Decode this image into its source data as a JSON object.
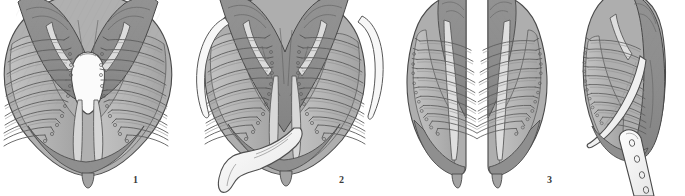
{
  "plate": {
    "kind": "scientific-anatomical-illustration",
    "subject": "bivalve mollusc gill / ctenidium dissections, ventral and lateral views",
    "background_color": "#ffffff",
    "width": 685,
    "height": 196,
    "style": "grayscale stippled line drawing, halftone shading"
  },
  "palette": {
    "background": "#ffffff",
    "outline": "#4a4a4a",
    "outline_dark": "#3c3c3c",
    "mantle_dark": "#8e8e8e",
    "mantle_mid": "#9e9e9e",
    "lamella_light": "#b4b4b4",
    "lamella_pale": "#c4c4c4",
    "rib_fill": "#a8a8a8",
    "rib_stroke": "#5a5a5a",
    "appendage_white": "#f6f6f6",
    "cavity_white": "#fbfbfb",
    "label_color": "#3a3a3a"
  },
  "figures": [
    {
      "number": "1",
      "label_x": 136,
      "label_y": 180,
      "view": "ventral whole-gill view, symmetric, central white cavity",
      "center_x": 88,
      "has_central_cavity": true,
      "has_detached_filament": false,
      "has_white_appendage": false,
      "has_blade": false,
      "rib_count_per_side": 11
    },
    {
      "number": "2",
      "label_x": 342,
      "label_y": 180,
      "view": "ventral whole-gill view with detached marginal filaments and everted white palp",
      "center_x": 285,
      "has_central_cavity": false,
      "has_detached_filament": true,
      "has_white_appendage": true,
      "has_blade": false,
      "rib_count_per_side": 11
    },
    {
      "number": "3",
      "label_x": 550,
      "label_y": 180,
      "view": "paired lateral half-gill views, left and right demibranchs separated",
      "center_x": 475,
      "has_central_cavity": false,
      "has_detached_filament": false,
      "has_white_appendage": false,
      "has_blade": false,
      "rib_count_per_side": 10
    },
    {
      "number": "",
      "label_x": 0,
      "label_y": 0,
      "view": "rightmost lateral demibranch with perforated white blade-like appendage",
      "center_x": 630,
      "has_central_cavity": false,
      "has_detached_filament": false,
      "has_white_appendage": false,
      "has_blade": true,
      "blade_perforations": 4,
      "rib_count_per_side": 10
    }
  ],
  "labels": {
    "fig1": "1",
    "fig2": "2",
    "fig3": "3"
  }
}
